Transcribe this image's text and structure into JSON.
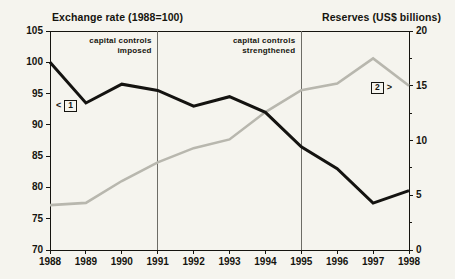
{
  "header": {
    "left_title": "Exchange rate (1988=100)",
    "right_title": "Reserves (US$ billions)"
  },
  "annotations": [
    {
      "id": "capital-controls-imposed",
      "line1": "capital controls",
      "line2": "imposed",
      "at_year": 1991
    },
    {
      "id": "capital-controls-strengthened",
      "line1": "capital controls",
      "line2": "strengthened",
      "at_year": 1995
    }
  ],
  "markers": [
    {
      "id": "marker-1",
      "label": "1",
      "arrow": "<",
      "series": "Exchange rate"
    },
    {
      "id": "marker-2",
      "label": "2",
      "arrow": ">",
      "series": "Reserves"
    }
  ],
  "colors": {
    "exchange_rate_line": "#141310",
    "reserves_line": "#b8b7ae",
    "axis": "#15140f",
    "background": "#f5f4ee",
    "vline": "#6d6c66"
  },
  "chart_data": {
    "type": "line",
    "title": "",
    "xlabel": "",
    "grid": false,
    "legend_position": "none",
    "x": [
      1988,
      1989,
      1990,
      1991,
      1992,
      1993,
      1994,
      1995,
      1996,
      1997,
      1998
    ],
    "xtick_labels": [
      "1988",
      "1989",
      "1990",
      "1991",
      "1992",
      "1993",
      "1994",
      "1995",
      "1996",
      "1997",
      "1998"
    ],
    "xlim": [
      1988,
      1998
    ],
    "axes": [
      {
        "id": "left",
        "label": "Exchange rate (1988=100)",
        "ylim": [
          70,
          105
        ],
        "ticks": [
          70,
          75,
          80,
          85,
          90,
          95,
          100,
          105
        ],
        "tick_labels": [
          "70",
          "75",
          "80",
          "85",
          "90",
          "95",
          "100",
          "105"
        ]
      },
      {
        "id": "right",
        "label": "Reserves (US$ billions)",
        "ylim": [
          0,
          20
        ],
        "ticks": [
          0,
          5,
          10,
          15,
          20
        ],
        "tick_labels": [
          "0",
          "5",
          "10",
          "15",
          "20"
        ],
        "minor_ticks": [
          2.5,
          7.5,
          12.5,
          17.5
        ]
      }
    ],
    "series": [
      {
        "name": "Exchange rate (1988=100)",
        "axis": "left",
        "color": "#141310",
        "marker_ref": "1",
        "values": [
          100.0,
          93.5,
          96.5,
          95.5,
          93.0,
          94.5,
          92.0,
          86.5,
          83.0,
          77.5,
          79.5
        ]
      },
      {
        "name": "Reserves (US$ billions)",
        "axis": "right",
        "color": "#b8b7ae",
        "marker_ref": "2",
        "values": [
          4.1,
          4.3,
          6.3,
          8.0,
          9.3,
          10.1,
          12.6,
          14.6,
          15.2,
          17.5,
          15.0
        ]
      }
    ],
    "vertical_lines": [
      {
        "x": 1991,
        "note": "capital controls imposed"
      },
      {
        "x": 1995,
        "note": "capital controls strengthened"
      }
    ]
  }
}
